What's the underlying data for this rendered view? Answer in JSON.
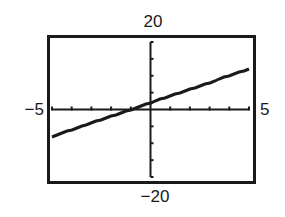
{
  "window": {
    "xmin_label": "−5",
    "xmax_label": "5",
    "ymin_label": "−20",
    "ymax_label": "20"
  },
  "chart_data": {
    "type": "line",
    "title": "",
    "xlabel": "",
    "ylabel": "",
    "xlim": [
      -5,
      5
    ],
    "ylim": [
      -20,
      20
    ],
    "xscl": 1,
    "yscl": 5,
    "grid": false,
    "legend": null,
    "series": [
      {
        "name": "y = 2x + 2",
        "equation": "y = 2x + 2",
        "slope": 2,
        "intercept": 2,
        "x": [
          -5,
          -4,
          -3,
          -2,
          -1,
          0,
          1,
          2,
          3,
          4,
          5
        ],
        "values": [
          -8,
          -6,
          -4,
          -2,
          0,
          2,
          4,
          6,
          8,
          10,
          12
        ]
      }
    ],
    "tick_labels": {
      "x": [
        "−5",
        "5"
      ],
      "y": [
        "−20",
        "20"
      ]
    }
  },
  "colors": {
    "ink": "#1a1a1a",
    "background": "#ffffff"
  }
}
